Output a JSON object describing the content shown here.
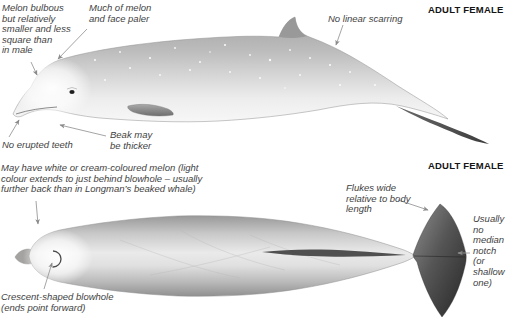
{
  "figure": {
    "top": {
      "heading": "ADULT FEMALE",
      "labels": {
        "melon_bulbous": "Melon bulbous\nbut relatively\nsmaller and less\nsquare than\nin male",
        "melon_paler": "Much of melon\nand face paler",
        "no_linear_scarring": "No linear scarring",
        "no_erupted_teeth": "No erupted teeth",
        "beak_thicker": "Beak may\nbe thicker"
      }
    },
    "bottom": {
      "heading": "ADULT FEMALE",
      "labels": {
        "melon_colour": "May have white or cream-coloured melon (light\ncolour extends to just behind blowhole – usually\nfurther back than in Longman’s beaked whale)",
        "flukes_wide": "Flukes wide\nrelative to body\nlength",
        "median_notch": "Usually\nno\nmedian\nnotch\n(or\nshallow\none)",
        "blowhole": "Crescent-shaped blowhole\n(ends point forward)"
      }
    },
    "colors": {
      "background": "#ffffff",
      "annotation_text": "#3f3f3f",
      "heading_text": "#141414",
      "leader_line": "#9a9a9a",
      "body_light": "#ececec",
      "body_dark": "#a0a0a0",
      "fluke_dark": "#2f2f2f"
    }
  }
}
